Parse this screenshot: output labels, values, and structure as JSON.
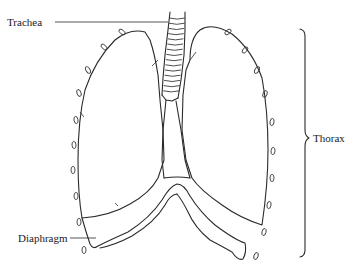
{
  "figure": {
    "type": "anatomical-line-drawing"
  },
  "labels": {
    "trachea": "Trachea",
    "diaphragm": "Diaphragm",
    "thorax": "Thorax"
  },
  "colors": {
    "line": "#2a2a2a",
    "background": "#ffffff",
    "text": "#1a1a1a"
  }
}
